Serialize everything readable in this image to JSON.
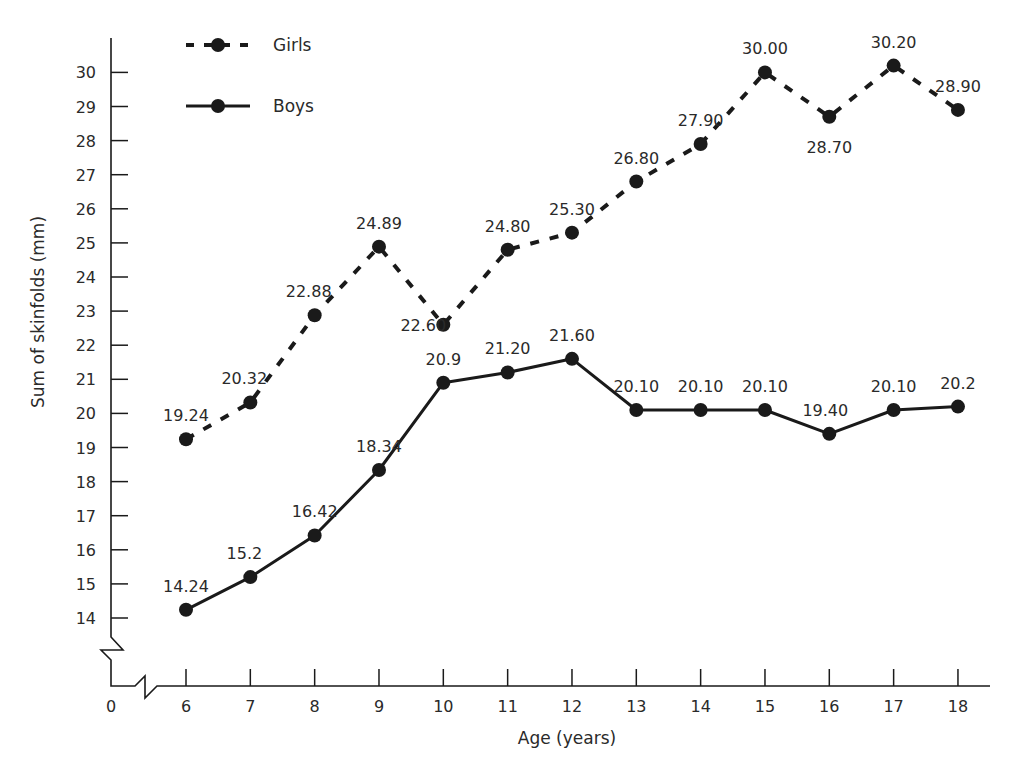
{
  "chart_data": {
    "type": "line",
    "title": "",
    "xlabel": "Age (years)",
    "ylabel": "Sum of skinfolds (mm)",
    "x": [
      6,
      7,
      8,
      9,
      10,
      11,
      12,
      13,
      14,
      15,
      16,
      17,
      18
    ],
    "x_tick_labels": [
      "0",
      "6",
      "7",
      "8",
      "9",
      "10",
      "11",
      "12",
      "13",
      "14",
      "15",
      "16",
      "17",
      "18"
    ],
    "y_tick_labels": [
      "14",
      "15",
      "16",
      "17",
      "18",
      "19",
      "20",
      "21",
      "22",
      "23",
      "24",
      "25",
      "26",
      "27",
      "28",
      "29",
      "30"
    ],
    "ylim": [
      14,
      30
    ],
    "axis_breaks": [
      "y-axis below 14",
      "x-axis between 0 and 6"
    ],
    "grid": false,
    "legend_position": "top-left",
    "series": [
      {
        "name": "Girls",
        "style": "dashed",
        "marker": "filled-circle",
        "values": [
          19.24,
          20.32,
          22.88,
          24.89,
          22.6,
          24.8,
          25.3,
          26.8,
          27.9,
          30.0,
          28.7,
          30.2,
          28.9
        ],
        "labels": [
          "19.24",
          "20.32",
          "22.88",
          "24.89",
          "22.60",
          "24.80",
          "25.30",
          "26.80",
          "27.90",
          "30.00",
          "28.70",
          "30.20",
          "28.90"
        ]
      },
      {
        "name": "Boys",
        "style": "solid",
        "marker": "filled-circle",
        "values": [
          14.24,
          15.2,
          16.42,
          18.34,
          20.9,
          21.2,
          21.6,
          20.1,
          20.1,
          20.1,
          19.4,
          20.1,
          20.2
        ],
        "labels": [
          "14.24",
          "15.2",
          "16.42",
          "18.34",
          "20.9",
          "21.20",
          "21.60",
          "20.10",
          "20.10",
          "20.10",
          "19.40",
          "20.10",
          "20.2"
        ]
      }
    ]
  },
  "colors": {
    "ink": "#1a1a1a",
    "text": "#2a2a2a",
    "background": "#ffffff"
  }
}
